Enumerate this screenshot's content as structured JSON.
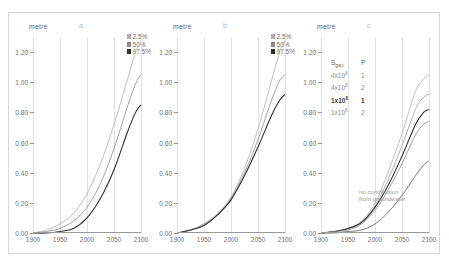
{
  "figure": {
    "axis_unit_label": "metre",
    "panels": [
      {
        "letter": "a",
        "legend": [
          {
            "label": "2.5%",
            "color": "#b0b0b0"
          },
          {
            "label": "50%",
            "color": "#8a8a8a"
          },
          {
            "label": "97.5%",
            "color": "#2e2e2e"
          }
        ]
      },
      {
        "letter": "b",
        "legend": [
          {
            "label": "2.5%",
            "color": "#b0b0b0"
          },
          {
            "label": "50%",
            "color": "#8a8a8a"
          },
          {
            "label": "97.5%",
            "color": "#2e2e2e"
          }
        ]
      },
      {
        "letter": "c",
        "legend_table": {
          "header": {
            "col1": "S",
            "col1_sub": "gw,t",
            "col2": "P"
          },
          "rows": [
            {
              "coef": "4x10",
              "exp": "8",
              "p": "1",
              "emphasis": "light"
            },
            {
              "coef": "4x10",
              "exp": "8",
              "p": "2",
              "emphasis": "light"
            },
            {
              "coef": "1x10",
              "exp": "8",
              "p": "1",
              "emphasis": "dark"
            },
            {
              "coef": "1x10",
              "exp": "8",
              "p": "2",
              "emphasis": "light"
            }
          ]
        },
        "annotation_line1": "no contribution",
        "annotation_line2": "from groundwater"
      }
    ]
  },
  "chart_data": [
    {
      "type": "line",
      "title": "a",
      "xlabel": "",
      "ylabel": "metre",
      "xlim": [
        1900,
        2100
      ],
      "ylim": [
        0.0,
        1.3
      ],
      "xticks": [
        1900,
        1950,
        2000,
        2050,
        2100
      ],
      "ytick_labels": [
        "0.00",
        "0.20",
        "0.40",
        "0.60",
        "0.80",
        "1.00",
        "1.20"
      ],
      "yticks": [
        0.0,
        0.2,
        0.4,
        0.6,
        0.8,
        1.0,
        1.2
      ],
      "grid": "vertical",
      "legend_position": "top-right",
      "x": [
        1900,
        1925,
        1950,
        1975,
        2000,
        2025,
        2050,
        2075,
        2090,
        2100
      ],
      "series": [
        {
          "name": "2.5%",
          "color": "#b0b0b0",
          "values": [
            0.0,
            0.02,
            0.06,
            0.13,
            0.26,
            0.46,
            0.72,
            1.02,
            1.2,
            1.26
          ]
        },
        {
          "name": "50%",
          "color": "#8a8a8a",
          "values": [
            0.0,
            0.01,
            0.03,
            0.08,
            0.17,
            0.33,
            0.56,
            0.84,
            0.99,
            1.05
          ]
        },
        {
          "name": "97.5%",
          "color": "#2e2e2e",
          "values": [
            0.0,
            0.0,
            0.01,
            0.03,
            0.1,
            0.23,
            0.42,
            0.67,
            0.8,
            0.85
          ]
        }
      ]
    },
    {
      "type": "line",
      "title": "b",
      "xlabel": "",
      "ylabel": "metre",
      "xlim": [
        1900,
        2100
      ],
      "ylim": [
        0.0,
        1.3
      ],
      "xticks": [
        1900,
        1950,
        2000,
        2050,
        2100
      ],
      "ytick_labels": [
        "0.00",
        "0.20",
        "0.40",
        "0.60",
        "0.80",
        "1.00",
        "1.20"
      ],
      "yticks": [
        0.0,
        0.2,
        0.4,
        0.6,
        0.8,
        1.0,
        1.2
      ],
      "grid": "vertical",
      "legend_position": "top-right",
      "x": [
        1900,
        1925,
        1950,
        1975,
        2000,
        2025,
        2050,
        2075,
        2090,
        2100
      ],
      "series": [
        {
          "name": "2.5%",
          "color": "#b0b0b0",
          "values": [
            0.0,
            0.02,
            0.06,
            0.13,
            0.24,
            0.43,
            0.69,
            1.01,
            1.2,
            1.28
          ]
        },
        {
          "name": "50%",
          "color": "#8a8a8a",
          "values": [
            0.0,
            0.02,
            0.06,
            0.12,
            0.23,
            0.4,
            0.62,
            0.88,
            1.01,
            1.05
          ]
        },
        {
          "name": "97.5%",
          "color": "#2e2e2e",
          "values": [
            0.0,
            0.02,
            0.05,
            0.12,
            0.22,
            0.38,
            0.57,
            0.78,
            0.88,
            0.92
          ]
        }
      ]
    },
    {
      "type": "line",
      "title": "c",
      "xlabel": "",
      "ylabel": "metre",
      "xlim": [
        1900,
        2100
      ],
      "ylim": [
        0.0,
        1.3
      ],
      "xticks": [
        1900,
        1950,
        2000,
        2050,
        2100
      ],
      "ytick_labels": [
        "0.00",
        "0.20",
        "0.40",
        "0.60",
        "0.80",
        "1.00",
        "1.20"
      ],
      "yticks": [
        0.0,
        0.2,
        0.4,
        0.6,
        0.8,
        1.0,
        1.2
      ],
      "grid": "vertical",
      "legend_position": "inside-left",
      "annotations": [
        "no contribution from groundwater"
      ],
      "x": [
        1900,
        1925,
        1950,
        1975,
        2000,
        2025,
        2050,
        2075,
        2090,
        2100
      ],
      "series": [
        {
          "name": "4x10^8 P=1",
          "color": "#b0b0b0",
          "values": [
            0.0,
            0.01,
            0.03,
            0.08,
            0.2,
            0.41,
            0.66,
            0.94,
            1.02,
            1.05
          ]
        },
        {
          "name": "4x10^8 P=2",
          "color": "#9e9e9e",
          "values": [
            0.0,
            0.01,
            0.03,
            0.07,
            0.18,
            0.36,
            0.58,
            0.82,
            0.9,
            0.92
          ]
        },
        {
          "name": "1x10^8 P=1",
          "color": "#2e2e2e",
          "values": [
            0.0,
            0.01,
            0.03,
            0.07,
            0.17,
            0.32,
            0.51,
            0.72,
            0.8,
            0.82
          ]
        },
        {
          "name": "1x10^8 P=2",
          "color": "#8a8a8a",
          "values": [
            0.0,
            0.01,
            0.02,
            0.06,
            0.15,
            0.29,
            0.46,
            0.65,
            0.72,
            0.74
          ]
        },
        {
          "name": "no contribution from groundwater",
          "color": "#5a5a5a",
          "values": [
            0.0,
            0.0,
            0.01,
            0.02,
            0.06,
            0.14,
            0.25,
            0.38,
            0.45,
            0.48
          ]
        }
      ]
    }
  ]
}
